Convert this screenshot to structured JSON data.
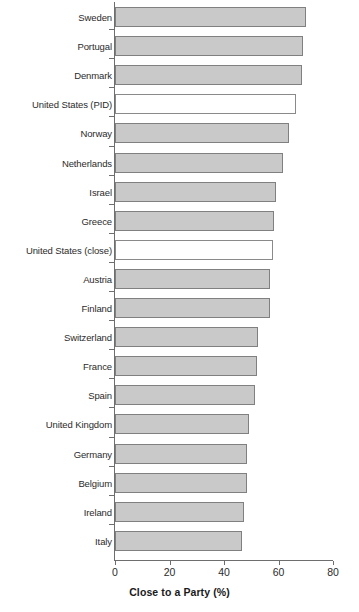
{
  "chart_data": {
    "type": "bar",
    "orientation": "horizontal",
    "title": "",
    "xlabel": "Close to a Party (%)",
    "ylabel": "",
    "xlim": [
      0,
      80
    ],
    "xticks": [
      0,
      20,
      40,
      60,
      80
    ],
    "grid": false,
    "legend": null,
    "categories": [
      "Sweden",
      "Portugal",
      "Denmark",
      "United States (PID)",
      "Norway",
      "Netherlands",
      "Israel",
      "Greece",
      "United States (close)",
      "Austria",
      "Finland",
      "Switzerland",
      "France",
      "Spain",
      "United Kingdom",
      "Germany",
      "Belgium",
      "Ireland",
      "Italy"
    ],
    "values": [
      70,
      69,
      68.5,
      66.5,
      64,
      61.5,
      59,
      58.5,
      58,
      57,
      57,
      52.5,
      52,
      51.5,
      49,
      48.5,
      48.5,
      47.5,
      46.5
    ],
    "highlight": [
      "United States (PID)",
      "United States (close)"
    ],
    "styles": {
      "bar_fill": "#c9c9c9",
      "bar_edge": "#808080",
      "highlight_fill": "#ffffff",
      "highlight_edge": "#8a8a8a",
      "axis_color": "#6e6e6e",
      "text_color": "#2b2b2b",
      "background": "#ffffff"
    }
  }
}
